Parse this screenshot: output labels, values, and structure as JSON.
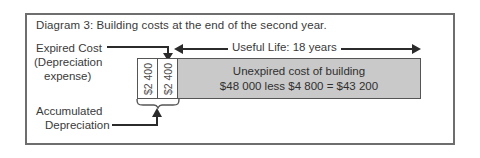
{
  "diagram": {
    "title": "Diagram 3: Building costs at the end of the second year.",
    "labels": {
      "expired_cost": "Expired Cost",
      "depreciation_line1": "(Depreciation",
      "depreciation_line2": "expense)",
      "accumulated_line1": "Accumulated",
      "accumulated_line2": "Depreciation",
      "useful_life": "Useful Life: 18 years"
    },
    "bar": {
      "expired_cells": [
        {
          "value": "$2 400"
        },
        {
          "value": "$2 400"
        }
      ],
      "unexpired": {
        "line1": "Unexpired cost of building",
        "line2": "$48 000 less $4 800 = $43 200"
      }
    },
    "colors": {
      "frame_border": "#6e6e6e",
      "bar_border": "#555555",
      "unexpired_fill": "#c9c9c9",
      "expired_fill": "#ffffff",
      "ink": "#2b2b2b",
      "text": "#3a3a3a",
      "page_background": "#ffffff"
    }
  }
}
